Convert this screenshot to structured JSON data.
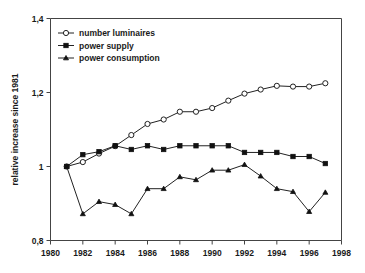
{
  "chart_data": {
    "type": "line",
    "title": "",
    "xlabel": "",
    "ylabel": "relative increase since 1981",
    "xlim": [
      1980,
      1998
    ],
    "ylim": [
      0.8,
      1.4
    ],
    "grid": false,
    "legend_position": "top-left",
    "x": [
      1981,
      1982,
      1983,
      1984,
      1985,
      1986,
      1987,
      1988,
      1989,
      1990,
      1991,
      1992,
      1993,
      1994,
      1995,
      1996,
      1997
    ],
    "xticks": [
      1980,
      1982,
      1984,
      1986,
      1988,
      1990,
      1992,
      1994,
      1996,
      1998
    ],
    "xtick_labels": [
      "1980",
      "1982",
      "1984",
      "1986",
      "1988",
      "1990",
      "1992",
      "1994",
      "1996",
      "1998"
    ],
    "yticks": [
      0.8,
      1.0,
      1.2,
      1.4
    ],
    "ytick_labels": [
      "0,8",
      "1",
      "1,2",
      "1,4"
    ],
    "series": [
      {
        "name": "number luminaires",
        "marker": "open-circle",
        "values": [
          1.0,
          1.012,
          1.035,
          1.055,
          1.085,
          1.115,
          1.127,
          1.148,
          1.148,
          1.158,
          1.178,
          1.197,
          1.208,
          1.218,
          1.216,
          1.216,
          1.225
        ]
      },
      {
        "name": "power supply",
        "marker": "filled-square",
        "values": [
          1.0,
          1.032,
          1.04,
          1.056,
          1.046,
          1.056,
          1.046,
          1.056,
          1.056,
          1.056,
          1.056,
          1.038,
          1.038,
          1.038,
          1.027,
          1.027,
          1.008
        ]
      },
      {
        "name": "power consumption",
        "marker": "filled-triangle",
        "values": [
          1.0,
          0.872,
          0.905,
          0.897,
          0.872,
          0.94,
          0.94,
          0.972,
          0.964,
          0.99,
          0.99,
          1.005,
          0.974,
          0.94,
          0.932,
          0.878,
          0.93
        ]
      }
    ]
  },
  "legend": {
    "items": [
      {
        "label": "number luminaires",
        "marker": "open-circle"
      },
      {
        "label": "power supply",
        "marker": "filled-square"
      },
      {
        "label": "power consumption",
        "marker": "filled-triangle"
      }
    ]
  }
}
